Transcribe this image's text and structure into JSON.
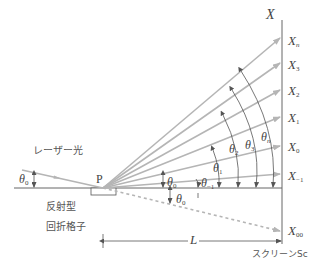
{
  "labels": {
    "laser": "レーザー光",
    "point_p": "P",
    "grating_line1": "反射型",
    "grating_line2": "回折格子",
    "screen": "スクリーンSc",
    "axis_x": "X",
    "distance": "L",
    "theta": "θ",
    "theta0_incident": "0",
    "screen_points": [
      {
        "base": "X",
        "sub": "n",
        "sub_italic": true
      },
      {
        "base": "X",
        "sub": "3"
      },
      {
        "base": "X",
        "sub": "2"
      },
      {
        "base": "X",
        "sub": "1"
      },
      {
        "base": "X",
        "sub": "0"
      },
      {
        "base": "X",
        "sub": "−1"
      },
      {
        "base": "X",
        "sub": "00"
      }
    ],
    "angles": [
      {
        "base": "θ",
        "sub": "0",
        "pos": "upper"
      },
      {
        "base": "θ",
        "sub": "0",
        "pos": "lower"
      },
      {
        "base": "θ",
        "sub": "−1"
      },
      {
        "base": "θ",
        "sub": "1"
      },
      {
        "base": "θ",
        "sub": "2"
      },
      {
        "base": "θ",
        "sub": "3"
      },
      {
        "base": "θ",
        "sub": "n",
        "sub_italic": true
      }
    ]
  },
  "colors": {
    "ray": "#b5b5b5",
    "axis": "#666666",
    "text": "#444444",
    "dashed": "#b5b5b5"
  }
}
